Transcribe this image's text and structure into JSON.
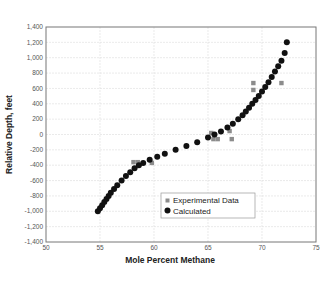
{
  "chart_data": {
    "type": "scatter",
    "title": "",
    "xlabel": "Mole Percent Methane",
    "ylabel": "Relative Depth, feet",
    "xlim": [
      50,
      75
    ],
    "ylim": [
      -1400,
      1400
    ],
    "xticks": [
      50,
      55,
      60,
      65,
      70,
      75
    ],
    "xtick_labels": [
      "50",
      "55",
      "60",
      "65",
      "70",
      "75"
    ],
    "yticks": [
      -1400,
      -1200,
      -1000,
      -800,
      -600,
      -400,
      -200,
      0,
      200,
      400,
      600,
      800,
      1000,
      1200,
      1400
    ],
    "ytick_labels": [
      "-1,400",
      "-1,200",
      "-1,000",
      "-800",
      "-600",
      "-400",
      "-200",
      "0",
      "200",
      "400",
      "600",
      "800",
      "1,000",
      "1,200",
      "1,400"
    ],
    "grid": true,
    "legend_position": "lower-center-right inside",
    "series": [
      {
        "name": "Experimental Data",
        "marker": "square",
        "color": "#8c8c8c",
        "x": [
          58.1,
          58.5,
          59.8,
          65.3,
          65.5,
          65.9,
          67.0,
          67.2,
          69.2,
          69.2,
          71.8
        ],
        "y": [
          -360,
          -360,
          -370,
          20,
          -60,
          -60,
          45,
          -60,
          580,
          670,
          670
        ]
      },
      {
        "name": "Calculated",
        "marker": "circle",
        "color": "#111111",
        "x": [
          54.8,
          55.0,
          55.2,
          55.4,
          55.6,
          55.8,
          56.0,
          56.3,
          56.6,
          57.0,
          57.4,
          57.8,
          58.2,
          58.6,
          59.0,
          59.6,
          60.3,
          61.0,
          62.0,
          63.0,
          64.0,
          65.0,
          65.6,
          66.2,
          66.8,
          67.3,
          67.8,
          68.2,
          68.5,
          68.8,
          69.1,
          69.4,
          69.7,
          70.0,
          70.3,
          70.6,
          70.9,
          71.2,
          71.5,
          71.8,
          72.1,
          72.3
        ],
        "y": [
          -1000,
          -960,
          -920,
          -880,
          -840,
          -800,
          -760,
          -710,
          -660,
          -600,
          -540,
          -490,
          -440,
          -400,
          -370,
          -330,
          -290,
          -250,
          -200,
          -150,
          -100,
          -40,
          0,
          40,
          90,
          140,
          200,
          250,
          300,
          350,
          400,
          450,
          500,
          560,
          620,
          680,
          750,
          820,
          890,
          960,
          1060,
          1200
        ]
      }
    ]
  },
  "legend": {
    "items": [
      {
        "label": "Experimental Data",
        "marker": "square",
        "color": "#8c8c8c"
      },
      {
        "label": "Calculated",
        "marker": "circle",
        "color": "#111111"
      }
    ]
  },
  "colors": {
    "grid": "#dcdcdc",
    "axis": "#666666",
    "experimental": "#8c8c8c",
    "calculated": "#111111"
  }
}
